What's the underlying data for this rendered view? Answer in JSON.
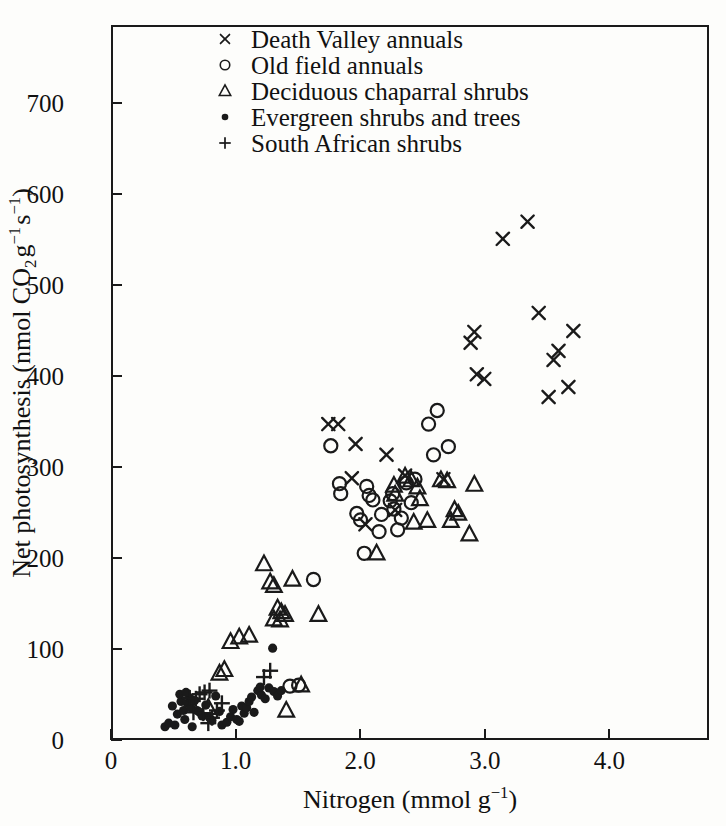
{
  "figure": {
    "width": 726,
    "height": 826,
    "background": "#fdfdfb",
    "ink": "#1a1a1a"
  },
  "axes": {
    "x_ticklabels": [
      "0",
      "1.0",
      "2.0",
      "3.0",
      "4.0"
    ],
    "x_tickvalues": [
      0,
      1.0,
      2.0,
      3.0,
      4.0
    ],
    "y_ticklabels": [
      "0",
      "100",
      "200",
      "300",
      "400",
      "500",
      "600",
      "700"
    ],
    "y_tickvalues": [
      0,
      100,
      200,
      300,
      400,
      500,
      600,
      700
    ]
  },
  "legend": {
    "entries": [
      {
        "marker": "cross-marker",
        "label": "Death Valley annuals"
      },
      {
        "marker": "circle-marker",
        "label": "Old field annuals"
      },
      {
        "marker": "triangle-marker",
        "label": "Deciduous chaparral shrubs"
      },
      {
        "marker": "dot-marker",
        "label": "Evergreen shrubs and trees"
      },
      {
        "marker": "plus-marker",
        "label": "South African shrubs"
      }
    ]
  },
  "chart_data": {
    "type": "scatter",
    "title": "",
    "xlabel": "Nitrogen (mmol g⁻¹)",
    "ylabel": "Net photosynthesis (nmol CO₂ g⁻¹ s⁻¹)",
    "xlabel_parts": {
      "text": "Nitrogen (mmol g",
      "sup": "−1",
      "tail": ")"
    },
    "ylabel_parts": {
      "text": "Net photosynthesis (nmol CO",
      "sub": "2",
      "mid": " g",
      "sup1": "−1",
      "mid2": " s",
      "sup2": "−1",
      "tail": ")"
    },
    "xlim": [
      0,
      4.8
    ],
    "ylim": [
      0,
      786
    ],
    "grid": false,
    "legend_position": "top-center",
    "series": [
      {
        "name": "Death Valley annuals",
        "marker": "x",
        "points": [
          [
            1.74,
            347
          ],
          [
            1.82,
            347
          ],
          [
            1.96,
            325
          ],
          [
            1.93,
            287
          ],
          [
            2.04,
            236
          ],
          [
            2.21,
            313
          ],
          [
            2.36,
            290
          ],
          [
            2.67,
            286
          ],
          [
            2.89,
            437
          ],
          [
            2.94,
            402
          ],
          [
            3.0,
            397
          ],
          [
            3.15,
            552
          ],
          [
            3.35,
            571
          ],
          [
            3.44,
            470
          ],
          [
            3.52,
            377
          ],
          [
            3.56,
            418
          ],
          [
            3.6,
            428
          ],
          [
            3.68,
            388
          ],
          [
            3.72,
            450
          ],
          [
            2.92,
            449
          ],
          [
            2.28,
            252
          ]
        ]
      },
      {
        "name": "Old field annuals",
        "marker": "o",
        "points": [
          [
            1.62,
            175
          ],
          [
            1.76,
            323
          ],
          [
            1.83,
            281
          ],
          [
            1.84,
            270
          ],
          [
            1.97,
            248
          ],
          [
            2.0,
            241
          ],
          [
            2.05,
            278
          ],
          [
            2.07,
            268
          ],
          [
            2.03,
            204
          ],
          [
            2.1,
            263
          ],
          [
            2.15,
            228
          ],
          [
            2.24,
            262
          ],
          [
            2.26,
            270
          ],
          [
            2.27,
            253
          ],
          [
            2.3,
            230
          ],
          [
            2.37,
            282
          ],
          [
            2.33,
            243
          ],
          [
            2.44,
            286
          ],
          [
            2.55,
            347
          ],
          [
            2.62,
            362
          ],
          [
            2.59,
            313
          ],
          [
            2.71,
            322
          ],
          [
            1.5,
            58
          ],
          [
            1.43,
            57
          ],
          [
            2.17,
            247
          ],
          [
            2.41,
            260
          ]
        ]
      },
      {
        "name": "Deciduous chaparral shrubs",
        "marker": "triangle",
        "points": [
          [
            0.86,
            71
          ],
          [
            0.9,
            75
          ],
          [
            1.02,
            111
          ],
          [
            1.1,
            113
          ],
          [
            0.95,
            106
          ],
          [
            1.22,
            192
          ],
          [
            1.27,
            172
          ],
          [
            1.3,
            168
          ],
          [
            1.33,
            143
          ],
          [
            1.36,
            139
          ],
          [
            1.3,
            131
          ],
          [
            1.35,
            130
          ],
          [
            1.39,
            136
          ],
          [
            1.45,
            175
          ],
          [
            1.4,
            30
          ],
          [
            1.52,
            58
          ],
          [
            2.13,
            204
          ],
          [
            2.27,
            279
          ],
          [
            2.28,
            269
          ],
          [
            2.36,
            289
          ],
          [
            2.41,
            285
          ],
          [
            2.46,
            277
          ],
          [
            2.48,
            264
          ],
          [
            2.54,
            240
          ],
          [
            2.65,
            285
          ],
          [
            2.7,
            284
          ],
          [
            2.73,
            240
          ],
          [
            2.76,
            252
          ],
          [
            2.79,
            248
          ],
          [
            2.92,
            280
          ],
          [
            2.88,
            225
          ],
          [
            2.43,
            238
          ],
          [
            1.66,
            136
          ],
          [
            0.77,
            33
          ]
        ]
      },
      {
        "name": "Evergreen shrubs and trees",
        "marker": "dot",
        "points": [
          [
            0.42,
            12
          ],
          [
            0.48,
            35
          ],
          [
            0.52,
            26
          ],
          [
            0.55,
            40
          ],
          [
            0.57,
            30
          ],
          [
            0.58,
            20
          ],
          [
            0.6,
            38
          ],
          [
            0.62,
            44
          ],
          [
            0.63,
            33
          ],
          [
            0.66,
            41
          ],
          [
            0.68,
            30
          ],
          [
            0.7,
            28
          ],
          [
            0.72,
            24
          ],
          [
            0.75,
            36
          ],
          [
            0.78,
            22
          ],
          [
            0.8,
            19
          ],
          [
            0.83,
            46
          ],
          [
            0.86,
            29
          ],
          [
            0.88,
            14
          ],
          [
            0.92,
            17
          ],
          [
            0.95,
            23
          ],
          [
            0.97,
            31
          ],
          [
            1.0,
            20
          ],
          [
            1.02,
            18
          ],
          [
            1.04,
            35
          ],
          [
            1.06,
            27
          ],
          [
            1.08,
            33
          ],
          [
            1.1,
            40
          ],
          [
            1.12,
            45
          ],
          [
            1.14,
            28
          ],
          [
            1.17,
            52
          ],
          [
            1.2,
            47
          ],
          [
            1.23,
            43
          ],
          [
            1.26,
            55
          ],
          [
            1.3,
            51
          ],
          [
            1.33,
            46
          ],
          [
            1.36,
            52
          ],
          [
            1.29,
            99
          ],
          [
            0.45,
            16
          ],
          [
            0.5,
            14
          ],
          [
            0.54,
            48
          ],
          [
            0.59,
            50
          ],
          [
            0.64,
            12
          ],
          [
            1.19,
            56
          ]
        ]
      },
      {
        "name": "South African shrubs",
        "marker": "+",
        "points": [
          [
            0.62,
            44
          ],
          [
            0.67,
            43
          ],
          [
            0.7,
            48
          ],
          [
            0.74,
            50
          ],
          [
            0.78,
            52
          ],
          [
            0.73,
            27
          ],
          [
            0.77,
            16
          ],
          [
            0.8,
            22
          ],
          [
            0.84,
            30
          ],
          [
            1.22,
            67
          ],
          [
            1.27,
            74
          ],
          [
            0.65,
            28
          ],
          [
            0.88,
            38
          ]
        ]
      }
    ]
  }
}
